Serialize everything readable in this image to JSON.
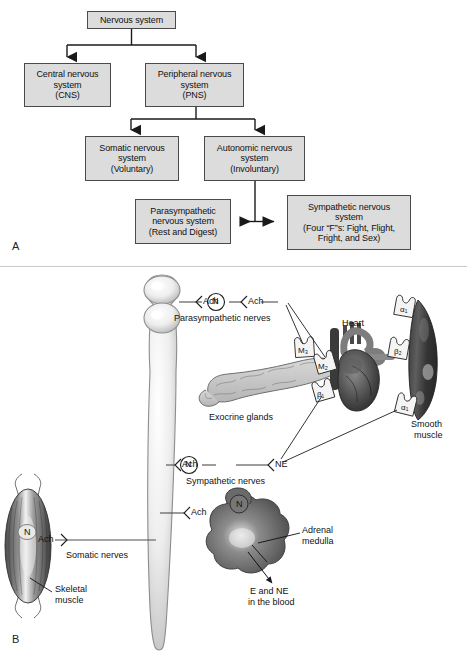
{
  "figure": {
    "panel_a_letter": "A",
    "panel_b_letter": "B"
  },
  "panel_a": {
    "title": "Organization of the nervous system",
    "boxes": [
      {
        "id": "nervous-system",
        "lines": [
          "Nervous system"
        ]
      },
      {
        "id": "cns",
        "lines": [
          "Central nervous",
          "system",
          "(CNS)"
        ]
      },
      {
        "id": "pns",
        "lines": [
          "Peripheral nervous",
          "system",
          "(PNS)"
        ]
      },
      {
        "id": "somatic",
        "lines": [
          "Somatic nervous",
          "system",
          "(Voluntary)"
        ]
      },
      {
        "id": "autonomic",
        "lines": [
          "Autonomic nervous",
          "system",
          "(Involuntary)"
        ]
      },
      {
        "id": "parasympathetic",
        "lines": [
          "Parasympathetic",
          "nervous system",
          "(Rest and Digest)"
        ]
      },
      {
        "id": "sympathetic",
        "lines": [
          "Sympathetic nervous",
          "system",
          "(Four “F”s: Fight, Flight,",
          "Fright, and Sex)"
        ]
      }
    ]
  },
  "panel_b": {
    "title": "Neurotransmitters and receptors of the autonomic, somatic and adrenal pathways",
    "pathways": {
      "parasympathetic": {
        "pre_transmitter": "Ach",
        "ganglion_receptor": "N",
        "post_transmitter": "Ach",
        "label": "Parasympathetic nerves"
      },
      "sympathetic": {
        "pre_transmitter": "Ach",
        "ganglion_receptor": "N",
        "post_transmitter": "NE",
        "label": "Sympathetic nerves"
      },
      "somatic": {
        "transmitter": "Ach",
        "receptor": "N",
        "label": "Somatic nerves"
      },
      "adrenal": {
        "transmitter": "Ach",
        "receptor": "N",
        "label": "Adrenal medulla",
        "output": "E and NE\nin the blood",
        "output_line1": "E and NE",
        "output_line2": "in the blood"
      }
    },
    "organs": [
      {
        "id": "exocrine-glands",
        "label": "Exocrine glands",
        "receptors": [
          "M3"
        ]
      },
      {
        "id": "heart",
        "label": "Heart",
        "receptors": [
          "M2",
          "B1"
        ]
      },
      {
        "id": "smooth-muscle",
        "label_line1": "Smooth",
        "label_line2": "muscle",
        "receptors": [
          "a1",
          "B2",
          "a1"
        ]
      },
      {
        "id": "skeletal-muscle",
        "label_line1": "Skeletal",
        "label_line2": "muscle",
        "receptors": [
          "N"
        ]
      },
      {
        "id": "adrenal-medulla",
        "label_line1": "Adrenal",
        "label_line2": "medulla",
        "receptors": [
          "N"
        ]
      }
    ],
    "receptor_glyphs": {
      "m3": "M₃",
      "m2": "M₂",
      "b1": "β₁",
      "b2": "β₂",
      "a1_top": "α₁",
      "a1_bottom": "α₁"
    }
  },
  "colors": {
    "box_fill": "#dcdcdc",
    "box_border": "#4a4a4a",
    "text": "#111111",
    "organ_dark": "#4b4b4b",
    "organ_light": "#d3d3d3",
    "line": "#555555"
  }
}
